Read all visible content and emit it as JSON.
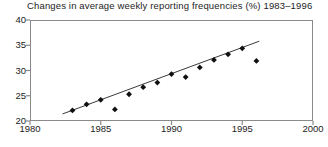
{
  "chart_data": {
    "type": "scatter",
    "title": "Changes in average weekly reporting frequencies (%) 1983–1996",
    "xlabel": "",
    "ylabel": "",
    "xlim": [
      1980,
      2000
    ],
    "ylim": [
      20,
      40
    ],
    "xticks": [
      1980,
      1985,
      1990,
      1995,
      2000
    ],
    "yticks": [
      20,
      25,
      30,
      35,
      40
    ],
    "xtick_labels": [
      "1980",
      "1985",
      "1990",
      "1995",
      "2000"
    ],
    "ytick_labels": [
      "20",
      "25",
      "30",
      "35",
      "40"
    ],
    "grid": false,
    "legend": "none",
    "marker": "filled-diamond",
    "marker_color": "#101010",
    "line_color": "#3a3a3a",
    "frame_color": "#8a8a8a",
    "series": [
      {
        "name": "Average weekly reporting frequency",
        "x": [
          1983,
          1984,
          1985,
          1986,
          1987,
          1988,
          1989,
          1990,
          1991,
          1992,
          1993,
          1994,
          1995,
          1996
        ],
        "y": [
          22.1,
          23.3,
          24.2,
          22.3,
          25.3,
          26.7,
          27.6,
          29.3,
          28.7,
          30.6,
          32.1,
          33.2,
          34.4,
          31.9
        ]
      }
    ],
    "trend_line": {
      "name": "linear fit",
      "x_start": 1982.3,
      "y_start": 21.4,
      "x_end": 1996.2,
      "y_end": 35.8
    }
  }
}
